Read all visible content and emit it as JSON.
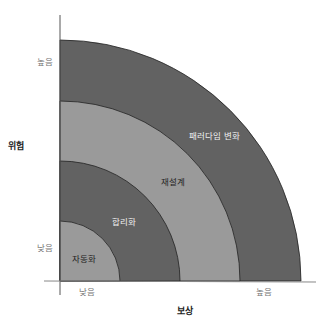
{
  "diagram": {
    "x_axis": {
      "title": "보상",
      "low_label": "낮음",
      "high_label": "높음"
    },
    "y_axis": {
      "title": "위험",
      "low_label": "낮음",
      "high_label": "높음"
    },
    "bands": [
      {
        "label": "자동화",
        "fill": "#9a9a9a",
        "text_color": "#222222"
      },
      {
        "label": "합리화",
        "fill": "#626262",
        "text_color": "#f0f0f0"
      },
      {
        "label": "재설계",
        "fill": "#9a9a9a",
        "text_color": "#222222"
      },
      {
        "label": "패러다임 변화",
        "fill": "#626262",
        "text_color": "#f0f0f0"
      }
    ],
    "colors": {
      "light_band": "#9a9a9a",
      "dark_band": "#626262",
      "axis": "#555555",
      "arc_stroke": "#222222"
    }
  }
}
